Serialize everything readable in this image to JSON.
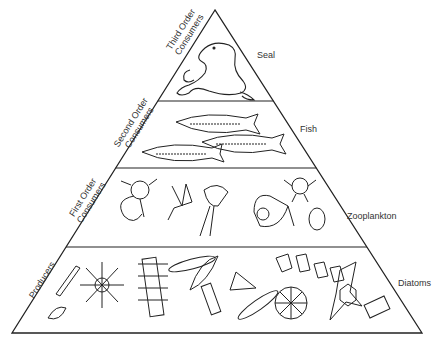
{
  "diagram": {
    "type": "food-pyramid",
    "levels": [
      {
        "tier": "Third Order Consumers",
        "line1": "Third Order",
        "line2": "Consumers",
        "organism": "Seal"
      },
      {
        "tier": "Second Order Consumers",
        "line1": "Second Order",
        "line2": "Consumers",
        "organism": "Fish"
      },
      {
        "tier": "First Order Consumers",
        "line1": "First Order",
        "line2": "Consumers",
        "organism": "Zooplankton"
      },
      {
        "tier": "Producers",
        "line1": "Producers",
        "line2": "",
        "organism": "Diatoms"
      }
    ],
    "colors": {
      "line": "#222222",
      "background": "#ffffff"
    }
  }
}
